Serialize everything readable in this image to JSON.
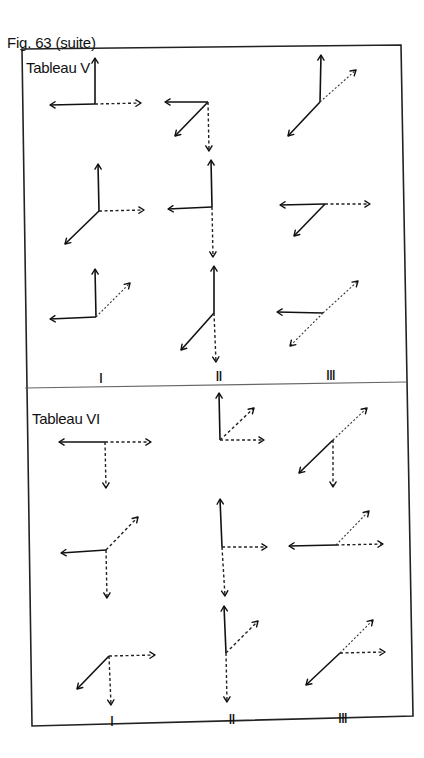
{
  "caption": "Fig. 63 (suite)",
  "frame": {
    "border_color": "#222222",
    "divider_color": "#666666",
    "corners": [
      [
        22,
        49
      ],
      [
        401,
        45
      ],
      [
        413,
        716
      ],
      [
        32,
        726
      ]
    ],
    "divider": [
      [
        25,
        388
      ],
      [
        406,
        382
      ]
    ]
  },
  "tableaux": [
    {
      "title": "Tableau V",
      "title_pos": [
        26,
        59
      ],
      "column_labels": [
        {
          "text": "I",
          "pos": [
            99,
            370
          ]
        },
        {
          "text": "II",
          "pos": [
            215,
            368
          ]
        },
        {
          "text": "III",
          "pos": [
            325,
            367
          ]
        }
      ],
      "diagrams": [
        {
          "id": "V-I-1",
          "origin": [
            95,
            104
          ],
          "vectors": [
            {
              "style": "solid",
              "to": [
                95,
                58
              ]
            },
            {
              "style": "solid",
              "to": [
                50,
                105
              ]
            },
            {
              "style": "dashed",
              "to": [
                141,
                103
              ]
            }
          ]
        },
        {
          "id": "V-II-1",
          "origin": [
            208,
            102
          ],
          "vectors": [
            {
              "style": "solid",
              "to": [
                165,
                102
              ]
            },
            {
              "style": "solid",
              "to": [
                175,
                136
              ]
            },
            {
              "style": "dashed",
              "to": [
                209,
                151
              ]
            }
          ]
        },
        {
          "id": "V-III-1",
          "origin": [
            320,
            102
          ],
          "vectors": [
            {
              "style": "solid",
              "to": [
                321,
                55
              ]
            },
            {
              "style": "dotted",
              "to": [
                356,
                70
              ]
            },
            {
              "style": "solid",
              "to": [
                288,
                136
              ]
            }
          ]
        },
        {
          "id": "V-I-2",
          "origin": [
            99,
            211
          ],
          "vectors": [
            {
              "style": "solid",
              "to": [
                98,
                164
              ]
            },
            {
              "style": "dashed",
              "to": [
                144,
                210
              ]
            },
            {
              "style": "solid",
              "to": [
                65,
                244
              ]
            }
          ]
        },
        {
          "id": "V-II-2",
          "origin": [
            212,
            207
          ],
          "vectors": [
            {
              "style": "solid",
              "to": [
                211,
                160
              ]
            },
            {
              "style": "solid",
              "to": [
                168,
                209
              ]
            },
            {
              "style": "dashed",
              "to": [
                213,
                257
              ]
            }
          ]
        },
        {
          "id": "V-III-2",
          "origin": [
            325,
            204
          ],
          "vectors": [
            {
              "style": "solid",
              "to": [
                280,
                205
              ]
            },
            {
              "style": "dashed",
              "to": [
                370,
                204
              ]
            },
            {
              "style": "solid",
              "to": [
                294,
                236
              ]
            }
          ]
        },
        {
          "id": "V-I-3",
          "origin": [
            96,
            317
          ],
          "vectors": [
            {
              "style": "solid",
              "to": [
                95,
                269
              ]
            },
            {
              "style": "solid",
              "to": [
                50,
                319
              ]
            },
            {
              "style": "dotted",
              "to": [
                130,
                283
              ]
            }
          ]
        },
        {
          "id": "V-II-3",
          "origin": [
            214,
            313
          ],
          "vectors": [
            {
              "style": "solid",
              "to": [
                214,
                266
              ]
            },
            {
              "style": "solid",
              "to": [
                181,
                350
              ]
            },
            {
              "style": "dashed",
              "to": [
                216,
                362
              ]
            }
          ]
        },
        {
          "id": "V-III-3",
          "origin": [
            323,
            313
          ],
          "vectors": [
            {
              "style": "solid",
              "to": [
                277,
                312
              ]
            },
            {
              "style": "dotted",
              "to": [
                358,
                281
              ]
            },
            {
              "style": "dotted",
              "to": [
                290,
                346
              ]
            }
          ]
        }
      ]
    },
    {
      "title": "Tableau VI",
      "title_pos": [
        32,
        410
      ],
      "column_labels": [
        {
          "text": "I",
          "pos": [
            110,
            713
          ]
        },
        {
          "text": "II",
          "pos": [
            228,
            711
          ]
        },
        {
          "text": "III",
          "pos": [
            337,
            710
          ]
        }
      ],
      "diagrams": [
        {
          "id": "VI-I-1",
          "origin": [
            105,
            442
          ],
          "vectors": [
            {
              "style": "solid",
              "to": [
                59,
                442
              ]
            },
            {
              "style": "dashed",
              "to": [
                151,
                442
              ]
            },
            {
              "style": "dashed",
              "to": [
                106,
                488
              ]
            }
          ]
        },
        {
          "id": "VI-II-1",
          "origin": [
            220,
            440
          ],
          "vectors": [
            {
              "style": "solid",
              "to": [
                219,
                393
              ]
            },
            {
              "style": "dashed",
              "to": [
                254,
                408
              ]
            },
            {
              "style": "dashed",
              "to": [
                264,
                440
              ]
            }
          ]
        },
        {
          "id": "VI-III-1",
          "origin": [
            333,
            440
          ],
          "vectors": [
            {
              "style": "dotted",
              "to": [
                367,
                408
              ]
            },
            {
              "style": "solid",
              "to": [
                299,
                473
              ]
            },
            {
              "style": "dashed",
              "to": [
                333,
                487
              ]
            }
          ]
        },
        {
          "id": "VI-I-2",
          "origin": [
            106,
            550
          ],
          "vectors": [
            {
              "style": "solid",
              "to": [
                61,
                553
              ]
            },
            {
              "style": "dashed",
              "to": [
                138,
                517
              ]
            },
            {
              "style": "dashed",
              "to": [
                107,
                598
              ]
            }
          ]
        },
        {
          "id": "VI-II-2",
          "origin": [
            222,
            547
          ],
          "vectors": [
            {
              "style": "solid",
              "to": [
                220,
                499
              ]
            },
            {
              "style": "dashed",
              "to": [
                267,
                547
              ]
            },
            {
              "style": "dashed",
              "to": [
                225,
                596
              ]
            }
          ]
        },
        {
          "id": "VI-III-2",
          "origin": [
            336,
            545
          ],
          "vectors": [
            {
              "style": "solid",
              "to": [
                289,
                546
              ]
            },
            {
              "style": "dotted",
              "to": [
                369,
                511
              ]
            },
            {
              "style": "dashed",
              "to": [
                383,
                544
              ]
            }
          ]
        },
        {
          "id": "VI-I-3",
          "origin": [
            109,
            656
          ],
          "vectors": [
            {
              "style": "solid",
              "to": [
                77,
                689
              ]
            },
            {
              "style": "dashed",
              "to": [
                155,
                655
              ]
            },
            {
              "style": "dashed",
              "to": [
                111,
                705
              ]
            }
          ]
        },
        {
          "id": "VI-II-3",
          "origin": [
            226,
            653
          ],
          "vectors": [
            {
              "style": "solid",
              "to": [
                224,
                606
              ]
            },
            {
              "style": "dashed",
              "to": [
                258,
                621
              ]
            },
            {
              "style": "dashed",
              "to": [
                227,
                702
              ]
            }
          ]
        },
        {
          "id": "VI-III-3",
          "origin": [
            340,
            653
          ],
          "vectors": [
            {
              "style": "dotted",
              "to": [
                373,
                620
              ]
            },
            {
              "style": "dashed",
              "to": [
                385,
                652
              ]
            },
            {
              "style": "solid",
              "to": [
                306,
                685
              ]
            }
          ]
        }
      ]
    }
  ]
}
